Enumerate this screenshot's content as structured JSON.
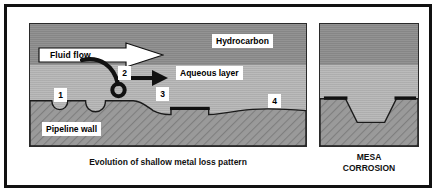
{
  "figure": {
    "main_panel": {
      "caption": "Evolution of shallow metal loss pattern",
      "layers": {
        "hydrocarbon_label": "Hydrocarbon",
        "aqueous_label": "Aqueous layer",
        "wall_label": "Pipeline wall"
      },
      "flow_arrow_label": "Fluid flow",
      "stage_labels": [
        "1",
        "2",
        "3",
        "4"
      ]
    },
    "mesa_panel": {
      "caption_line1": "MESA",
      "caption_line2": "CORROSION"
    },
    "colors": {
      "hydrocarbon": "#8d8d8d",
      "aqueous": "#b3b3b3",
      "steel": "#9a9a9a",
      "outline": "#111111",
      "chip_background": "#ffffff"
    }
  }
}
